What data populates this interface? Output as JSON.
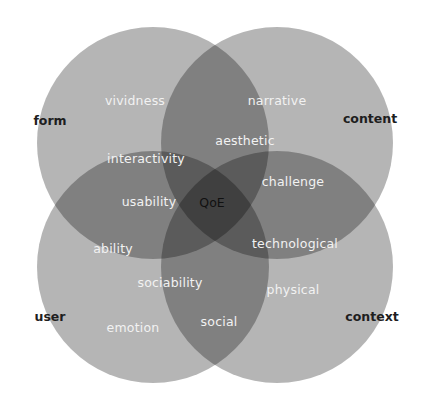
{
  "diagram": {
    "type": "four-set-venn",
    "center_label": "QoE",
    "sets": [
      {
        "name": "form",
        "position": "top-left"
      },
      {
        "name": "content",
        "position": "top-right"
      },
      {
        "name": "user",
        "position": "bottom-left"
      },
      {
        "name": "context",
        "position": "bottom-right"
      }
    ],
    "regions": {
      "form_only": "vividness",
      "content_only": "narrative",
      "form_content": "aesthetic",
      "form_user": "interactivity",
      "form_user_center": "usability",
      "content_context": "challenge",
      "content_context_center": "technological",
      "user_only_upper": "ability",
      "user_context": "sociability",
      "context_only": "physical",
      "user_only": "emotion",
      "user_context_lower": "social"
    },
    "colors": {
      "circle_fill": "#b5b5b5",
      "inner_text": "#f2f2f2",
      "outer_text": "#1e1e1e"
    }
  }
}
